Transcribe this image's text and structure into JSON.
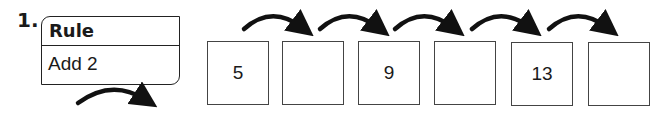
{
  "problem_number": "1.",
  "rule": {
    "heading": "Rule",
    "text": "Add 2"
  },
  "sequence": [
    "5",
    "",
    "9",
    "",
    "13",
    ""
  ],
  "icons": {
    "arrow": "curved-arrow-icon"
  }
}
